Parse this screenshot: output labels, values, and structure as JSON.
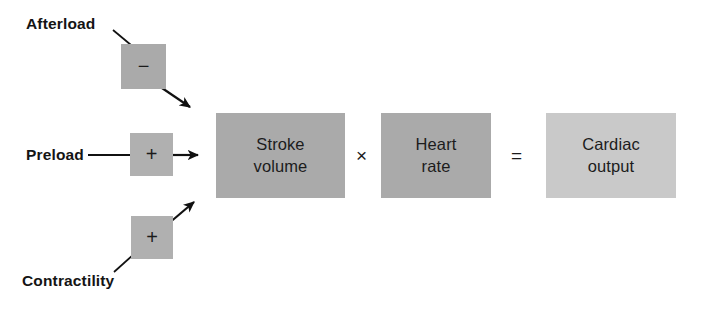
{
  "diagram": {
    "colors": {
      "box_dark_gray": "#aaaaaa",
      "box_mid_gray": "#b0b0b0",
      "box_light_gray": "#c9c9c9",
      "text_dark": "#1c1c1c",
      "line_black": "#111111",
      "background": "#ffffff"
    },
    "inputs": [
      {
        "id": "afterload",
        "label": "Afterload",
        "sign": "−",
        "sign_name": "minus-sign",
        "effect": "negative"
      },
      {
        "id": "preload",
        "label": "Preload",
        "sign": "+",
        "sign_name": "plus-sign",
        "effect": "positive"
      },
      {
        "id": "contractility",
        "label": "Contractility",
        "sign": "+",
        "sign_name": "plus-sign",
        "effect": "positive"
      }
    ],
    "equation": {
      "terms": [
        {
          "id": "stroke-volume",
          "line1": "Stroke",
          "line2": "volume"
        },
        {
          "id": "heart-rate",
          "line1": "Heart",
          "line2": "rate"
        },
        {
          "id": "cardiac-output",
          "line1": "Cardiac",
          "line2": "output"
        }
      ],
      "operators": [
        {
          "id": "multiply",
          "glyph": "×",
          "name": "multiplication-operator"
        },
        {
          "id": "equals",
          "glyph": "=",
          "name": "equals-operator"
        }
      ]
    }
  }
}
